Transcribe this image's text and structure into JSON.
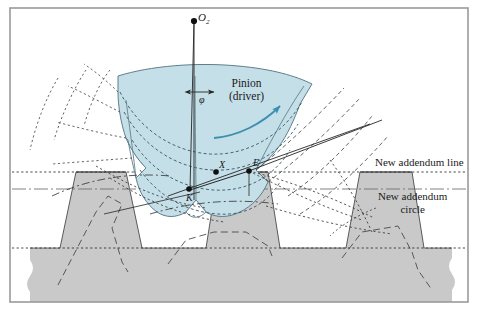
{
  "figure": {
    "background": "#ffffff",
    "border_color": "#9a9a9a",
    "colors": {
      "pinion_fill": "#c5dfe8",
      "pinion_stroke": "#5d7f8c",
      "rack_fill": "#c9c9c9",
      "rack_stroke": "#4a4a4a",
      "line": "#262626",
      "arrow_blue": "#3c8fb0",
      "dash_gray": "#555555"
    }
  },
  "labels": {
    "center": "O",
    "center_sub": "2",
    "pinion_line1": "Pinion",
    "pinion_line2": "(driver)",
    "pressure_angle": "φ",
    "point_x": "X",
    "point_e": "E",
    "point_k": "K",
    "addendum_line": "New addendum line",
    "addendum_circle_line1": "New addendum",
    "addendum_circle_line2": "circle"
  },
  "geometry": {
    "center_point": [
      194,
      21
    ],
    "point_x": [
      216,
      172
    ],
    "point_e": [
      249,
      171
    ],
    "point_k": [
      189,
      189
    ],
    "pitch_line_y": 189,
    "addendum_line_y": 172,
    "dedendum_line_y": 248,
    "rack_top_y": 172,
    "rack_body_y": 248,
    "frame": [
      10,
      8,
      458,
      294
    ]
  },
  "icons": {
    "rotation_arrow": "curved-arrow-icon",
    "angle_marker": "double-arrow-icon"
  }
}
